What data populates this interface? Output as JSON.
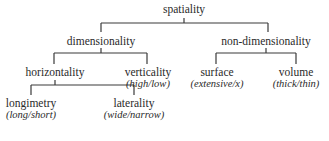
{
  "diagram": {
    "type": "tree",
    "nodes": {
      "root": {
        "label": "spatiality"
      },
      "dimensionality": {
        "label": "dimensionality"
      },
      "non_dimensionality": {
        "label": "non-dimensionality"
      },
      "horizontality": {
        "label": "horizontality"
      },
      "verticality": {
        "label": "verticality",
        "sub": "high/low"
      },
      "surface": {
        "label": "surface",
        "sub": "extensive/x"
      },
      "volume": {
        "label": "volume",
        "sub": "thick/thin"
      },
      "longimetry": {
        "label": "longimetry",
        "sub": "long/short"
      },
      "laterality": {
        "label": "laterality",
        "sub": "wide/narrow"
      }
    },
    "edges": [
      [
        "spatiality",
        "dimensionality"
      ],
      [
        "spatiality",
        "non-dimensionality"
      ],
      [
        "dimensionality",
        "horizontality"
      ],
      [
        "dimensionality",
        "verticality"
      ],
      [
        "non-dimensionality",
        "surface"
      ],
      [
        "non-dimensionality",
        "volume"
      ],
      [
        "horizontality",
        "longimetry"
      ],
      [
        "horizontality",
        "laterality"
      ]
    ],
    "line_color": "#3a3a3a",
    "text_color": "#2a2a2a"
  }
}
